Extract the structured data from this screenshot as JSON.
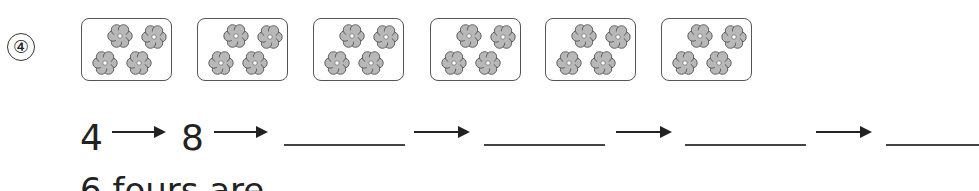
{
  "problem": {
    "number_label": "④",
    "groups": [
      {
        "flowers": 4
      },
      {
        "flowers": 4
      },
      {
        "flowers": 4
      },
      {
        "flowers": 4
      },
      {
        "flowers": 4
      },
      {
        "flowers": 4
      }
    ],
    "sequence": {
      "first": "4",
      "second": "8",
      "blanks": 4
    },
    "bottom_text": "6 fours are"
  },
  "colors": {
    "flower_fill": "#b8b8b8",
    "flower_stroke": "#555555",
    "box_border": "#555555",
    "text": "#222222"
  }
}
